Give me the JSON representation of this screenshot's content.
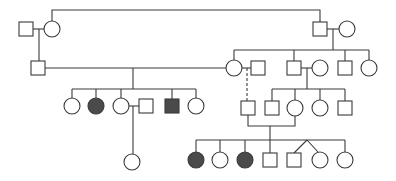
{
  "diagram": {
    "type": "pedigree",
    "colors": {
      "line": "#3a3a3a",
      "affected": "#4a4a4a",
      "unaffected": "#ffffff"
    },
    "individuals": [
      {
        "id": "I-1",
        "sex": "male",
        "affected": false,
        "x": 26,
        "y": 29
      },
      {
        "id": "I-2",
        "sex": "female",
        "affected": false,
        "x": 52,
        "y": 29
      },
      {
        "id": "I-3",
        "sex": "male",
        "affected": false,
        "x": 320,
        "y": 29
      },
      {
        "id": "I-4",
        "sex": "female",
        "affected": false,
        "x": 347,
        "y": 29
      },
      {
        "id": "II-1",
        "sex": "male",
        "affected": false,
        "x": 38,
        "y": 68
      },
      {
        "id": "II-2",
        "sex": "female",
        "affected": false,
        "x": 234,
        "y": 68
      },
      {
        "id": "II-3",
        "sex": "male",
        "affected": false,
        "x": 258,
        "y": 68
      },
      {
        "id": "II-4",
        "sex": "male",
        "affected": false,
        "x": 294,
        "y": 68
      },
      {
        "id": "II-5",
        "sex": "female",
        "affected": false,
        "x": 320,
        "y": 68
      },
      {
        "id": "II-6",
        "sex": "male",
        "affected": false,
        "x": 345,
        "y": 68
      },
      {
        "id": "II-7",
        "sex": "female",
        "affected": false,
        "x": 369,
        "y": 68
      },
      {
        "id": "III-1",
        "sex": "female",
        "affected": false,
        "x": 72,
        "y": 106
      },
      {
        "id": "III-2",
        "sex": "female",
        "affected": true,
        "x": 96,
        "y": 106
      },
      {
        "id": "III-3",
        "sex": "female",
        "affected": false,
        "x": 121,
        "y": 106
      },
      {
        "id": "III-4",
        "sex": "male",
        "affected": false,
        "x": 146,
        "y": 106
      },
      {
        "id": "III-5",
        "sex": "male",
        "affected": true,
        "x": 172,
        "y": 106
      },
      {
        "id": "III-6",
        "sex": "female",
        "affected": false,
        "x": 196,
        "y": 106
      },
      {
        "id": "III-7",
        "sex": "male",
        "affected": false,
        "x": 248,
        "y": 108
      },
      {
        "id": "III-8",
        "sex": "male",
        "affected": false,
        "x": 272,
        "y": 108
      },
      {
        "id": "III-9",
        "sex": "female",
        "affected": false,
        "x": 295,
        "y": 108
      },
      {
        "id": "III-10",
        "sex": "female",
        "affected": false,
        "x": 320,
        "y": 108
      },
      {
        "id": "III-11",
        "sex": "male",
        "affected": false,
        "x": 345,
        "y": 108
      },
      {
        "id": "IV-1",
        "sex": "female",
        "affected": false,
        "x": 132,
        "y": 162
      },
      {
        "id": "IV-2",
        "sex": "female",
        "affected": true,
        "x": 196,
        "y": 160
      },
      {
        "id": "IV-3",
        "sex": "female",
        "affected": false,
        "x": 220,
        "y": 160
      },
      {
        "id": "IV-4",
        "sex": "female",
        "affected": true,
        "x": 245,
        "y": 160
      },
      {
        "id": "IV-5",
        "sex": "male",
        "affected": false,
        "x": 270,
        "y": 160
      },
      {
        "id": "IV-6",
        "sex": "male",
        "affected": false,
        "x": 294,
        "y": 160,
        "twin": "IV-7"
      },
      {
        "id": "IV-7",
        "sex": "female",
        "affected": false,
        "x": 320,
        "y": 160,
        "twin": "IV-6"
      },
      {
        "id": "IV-8",
        "sex": "female",
        "affected": false,
        "x": 345,
        "y": 160
      }
    ],
    "relationships": [
      {
        "partners": [
          "I-1",
          "I-2"
        ],
        "children": [
          "II-1"
        ]
      },
      {
        "partners": [
          "I-3",
          "I-4"
        ],
        "children": [
          "II-2",
          "II-4",
          "II-6",
          "II-7"
        ]
      },
      {
        "partners": [
          "II-1",
          "II-2"
        ],
        "children": [
          "III-1",
          "III-2",
          "III-3",
          "III-5",
          "III-6"
        ]
      },
      {
        "partners": [
          "II-2",
          "II-3"
        ],
        "children": [
          "III-7"
        ],
        "line_style": "dashed"
      },
      {
        "partners": [
          "II-4",
          "II-5"
        ],
        "children": [
          "III-8",
          "III-9",
          "III-10",
          "III-11"
        ]
      },
      {
        "partners": [
          "III-3",
          "III-4"
        ],
        "children": [
          "IV-1"
        ]
      },
      {
        "partners": [
          "III-7",
          "III-9"
        ],
        "children": [
          "IV-2",
          "IV-3",
          "IV-4",
          "IV-5",
          "IV-6",
          "IV-7",
          "IV-8"
        ]
      }
    ]
  }
}
